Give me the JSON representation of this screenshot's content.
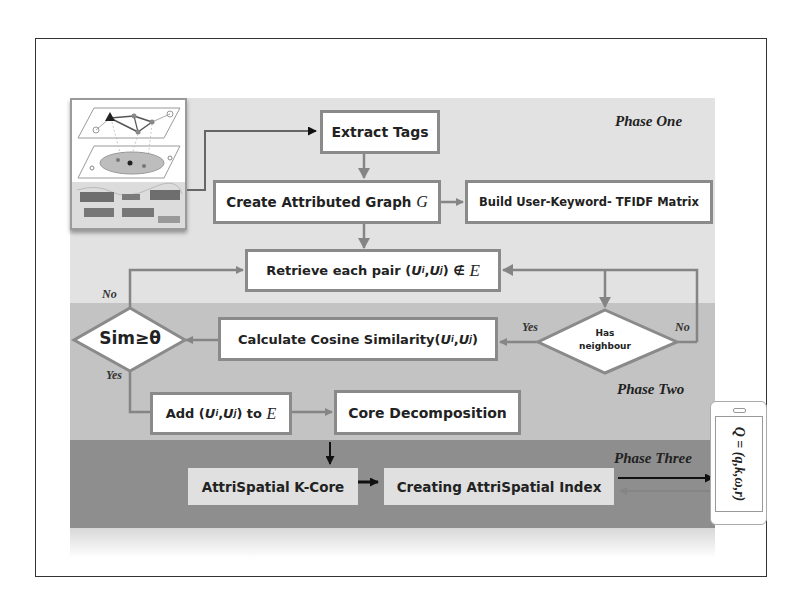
{
  "diagram": {
    "phases": [
      {
        "label": "Phase One",
        "color": "#e2e2e2"
      },
      {
        "label": "Phase Two",
        "color": "#c3c3c3"
      },
      {
        "label": "Phase Three",
        "color": "#8e8e8e"
      }
    ],
    "nodes": {
      "extract_tags": {
        "label": "Extract Tags"
      },
      "create_graph": {
        "label": "Create Attributed Graph ",
        "symbol": "G"
      },
      "build_matrix": {
        "label": "Build User-Keyword- TFIDF Matrix"
      },
      "retrieve_pair": {
        "label_pre": "Retrieve each pair (",
        "ui": "U",
        "ui_sub": "i",
        "comma": ",",
        "uj": "U",
        "uj_sub": "j",
        "label_post": ") ∉ ",
        "symbol": "E"
      },
      "has_neighbour": {
        "label_line1": "Has",
        "label_line2": "neighbour"
      },
      "calc_cosine": {
        "label_pre": "Calculate Cosine Similarity(",
        "ui": "U",
        "ui_sub": "i",
        "comma": ",",
        "uj": "U",
        "uj_sub": "j",
        "label_post": ")"
      },
      "sim_decision": {
        "label": "Sim≥θ"
      },
      "add_edge": {
        "label_pre": "Add (",
        "ui": "U",
        "ui_sub": "i",
        "comma": ",",
        "uj": "U",
        "uj_sub": "j",
        "label_post": ") to ",
        "symbol": "E"
      },
      "core_decomposition": {
        "label": "Core Decomposition"
      },
      "attrispatial_kcore": {
        "label": "AttriSpatial K-Core"
      },
      "creating_index": {
        "label": "Creating AttriSpatial Index"
      }
    },
    "edge_labels": {
      "has_neighbour_yes": "Yes",
      "has_neighbour_no": "No",
      "sim_yes": "Yes",
      "sim_no": "No"
    },
    "query": {
      "label": "Q = (q,k,ω,r)"
    },
    "colors": {
      "box_border": "#8a8a8a",
      "arrow_gray": "#858585",
      "arrow_black": "#111111"
    }
  }
}
